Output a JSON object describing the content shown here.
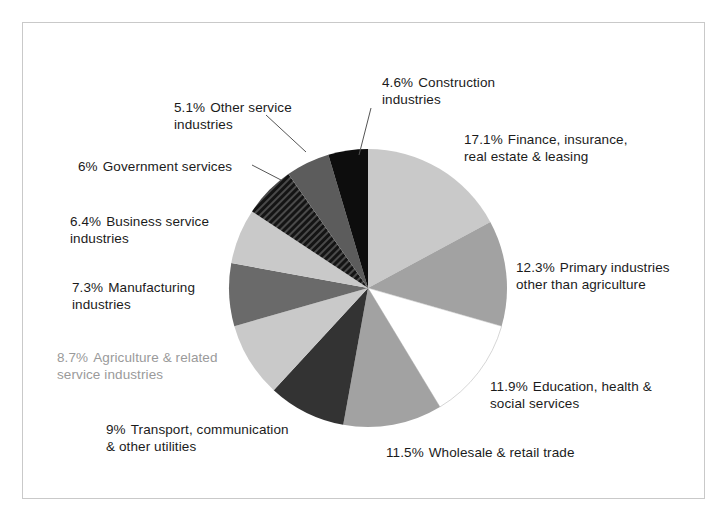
{
  "figure": {
    "frame_color": "#c9c9c9",
    "background": "#ffffff"
  },
  "chart_data": {
    "type": "pie",
    "title": "",
    "subtitle": "",
    "xlabel": "",
    "ylabel": "",
    "legend_position": "callout-labels",
    "grid": false,
    "total": 100.0,
    "start_angle_deg": 0,
    "direction": "clockwise",
    "categories": [
      "Finance, insurance, real estate & leasing",
      "Primary industries other than agriculture",
      "Education, health & social services",
      "Wholesale & retail trade",
      "Transport, communication & other utilities",
      "Agriculture & related service industries",
      "Manufacturing industries",
      "Business service industries",
      "Government services",
      "Other service industries",
      "Construction industries"
    ],
    "values": [
      17.1,
      12.3,
      11.9,
      11.5,
      9.0,
      8.7,
      7.3,
      6.4,
      6.0,
      5.1,
      4.6
    ],
    "value_labels": [
      "17.1%",
      "12.3%",
      "11.9%",
      "11.5%",
      "9%",
      "8.7%",
      "7.3%",
      "6.4%",
      "6%",
      "5.1%",
      "4.6%"
    ],
    "slice_colors": [
      "#c9c9c9",
      "#a2a2a2",
      "#ffffff",
      "#a2a2a2",
      "#333333",
      "#c9c9c9",
      "#6a6a6a",
      "#c9c9c9",
      "#242424",
      "#5c5c5c",
      "#0d0d0d"
    ],
    "slices": [
      {
        "label": "Finance, insurance, real estate & leasing",
        "value": 17.1,
        "value_label": "17.1%",
        "color": "#c9c9c9"
      },
      {
        "label": "Primary industries other than agriculture",
        "value": 12.3,
        "value_label": "12.3%",
        "color": "#a2a2a2"
      },
      {
        "label": "Education, health & social services",
        "value": 11.9,
        "value_label": "11.9%",
        "color": "#ffffff"
      },
      {
        "label": "Wholesale & retail trade",
        "value": 11.5,
        "value_label": "11.5%",
        "color": "#a2a2a2"
      },
      {
        "label": "Transport, communication & other utilities",
        "value": 9.0,
        "value_label": "9%",
        "color": "#333333"
      },
      {
        "label": "Agriculture & related service industries",
        "value": 8.7,
        "value_label": "8.7%",
        "color": "#c9c9c9"
      },
      {
        "label": "Manufacturing industries",
        "value": 7.3,
        "value_label": "7.3%",
        "color": "#6a6a6a"
      },
      {
        "label": "Business service industries",
        "value": 6.4,
        "value_label": "6.4%",
        "color": "#c9c9c9"
      },
      {
        "label": "Government services",
        "value": 6.0,
        "value_label": "6%",
        "color": "#242424"
      },
      {
        "label": "Other service industries",
        "value": 5.1,
        "value_label": "5.1%",
        "color": "#5c5c5c"
      },
      {
        "label": "Construction industries",
        "value": 4.6,
        "value_label": "4.6%",
        "color": "#0d0d0d"
      }
    ]
  },
  "labels": {
    "construction": {
      "pct": "4.6%",
      "line1": "Construction",
      "line2": "industries"
    },
    "finance": {
      "pct": "17.1%",
      "line1": "Finance, insurance,",
      "line2": "real estate & leasing"
    },
    "primary": {
      "pct": "12.3%",
      "line1": "Primary industries",
      "line2": "other than agriculture"
    },
    "education": {
      "pct": "11.9%",
      "line1": "Education, health &",
      "line2": "social services"
    },
    "wholesale": {
      "pct": "11.5%",
      "line1": "Wholesale & retail trade",
      "line2": ""
    },
    "transport": {
      "pct": "9%",
      "line1": "Transport, communication",
      "line2": "& other utilities"
    },
    "agriculture": {
      "pct": "8.7%",
      "line1": "Agriculture & related",
      "line2": "service industries"
    },
    "manufacturing": {
      "pct": "7.3%",
      "line1": "Manufacturing",
      "line2": "industries"
    },
    "business": {
      "pct": "6.4%",
      "line1": "Business service",
      "line2": "industries"
    },
    "government": {
      "pct": "6%",
      "line1": "Government services",
      "line2": ""
    },
    "other_service": {
      "pct": "5.1%",
      "line1": "Other service",
      "line2": "industries"
    }
  }
}
